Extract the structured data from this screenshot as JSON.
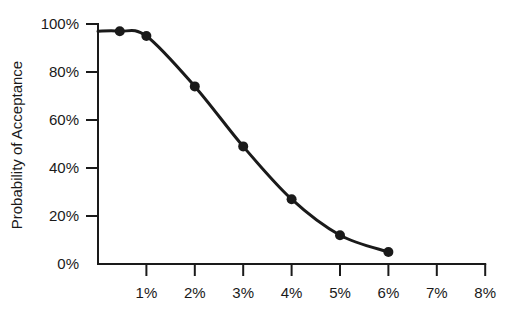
{
  "chart_data": {
    "type": "line",
    "title": "",
    "xlabel": "",
    "ylabel": "Probability of Acceptance",
    "x_tick_labels": [
      "1%",
      "2%",
      "3%",
      "4%",
      "5%",
      "6%",
      "7%",
      "8%"
    ],
    "y_tick_labels": [
      "0%",
      "20%",
      "40%",
      "60%",
      "80%",
      "100%"
    ],
    "xlim": [
      0,
      8
    ],
    "ylim": [
      0,
      100
    ],
    "grid": false,
    "legend": null,
    "series": [
      {
        "name": "OC curve",
        "x": [
          0.45,
          1,
          2,
          3,
          4,
          5,
          6
        ],
        "y": [
          97,
          95,
          74,
          49,
          27,
          12,
          5
        ],
        "markers": true,
        "smooth": true
      }
    ],
    "colors": {
      "line": "#1a1a1a",
      "marker": "#1a1a1a",
      "axis": "#1a1a1a"
    }
  }
}
